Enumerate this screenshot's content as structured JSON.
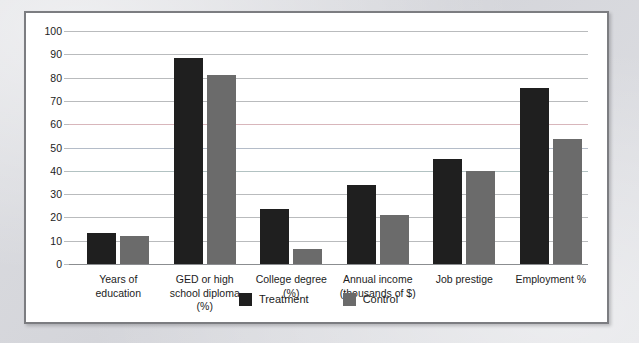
{
  "chart_data": {
    "type": "bar",
    "title": "",
    "xlabel": "",
    "ylabel": "",
    "ylim": [
      0,
      100
    ],
    "yticks": [
      0,
      10,
      20,
      30,
      40,
      50,
      60,
      70,
      80,
      90,
      100
    ],
    "grid": true,
    "legend_position": "bottom-center",
    "categories": [
      "Years of\neducation",
      "GED or high\nschool diploma\n(%)",
      "College degree\n(%)",
      "Annual income\n(thousands of $)",
      "Job prestige",
      "Employment %"
    ],
    "category_lines": [
      [
        "Years of",
        "education"
      ],
      [
        "GED or high",
        "school diploma",
        "(%)"
      ],
      [
        "College degree",
        "(%)"
      ],
      [
        "Annual income",
        "(thousands of $)"
      ],
      [
        "Job prestige"
      ],
      [
        "Employment %"
      ]
    ],
    "series": [
      {
        "name": "Treatment",
        "color": "#1f1f1f",
        "values": [
          13.5,
          88.5,
          23.5,
          33.7,
          45.0,
          75.5
        ]
      },
      {
        "name": "Control",
        "color": "#6b6b6b",
        "values": [
          12.2,
          81.0,
          6.3,
          21.0,
          40.0,
          53.5
        ]
      }
    ]
  },
  "legend": {
    "items": [
      {
        "label": "Treatment",
        "color": "#1f1f1f"
      },
      {
        "label": "Control",
        "color": "#6b6b6b"
      }
    ]
  },
  "colors": {
    "treatment": "#1f1f1f",
    "control": "#6b6b6b",
    "gridline": "#b9bbbd",
    "panel_border": "#7c7d81",
    "panel_background": "#ffffff",
    "page_background": "#d9dade"
  }
}
